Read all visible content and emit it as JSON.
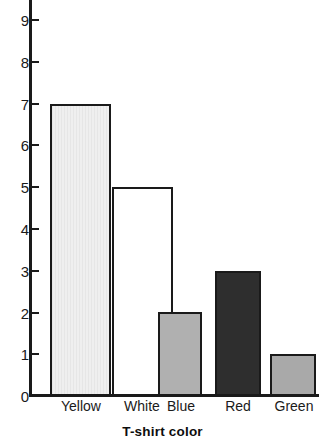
{
  "chart_data": {
    "type": "bar",
    "title": "",
    "subtitle": "",
    "xlabel": "T-shirt color",
    "ylabel": "",
    "categories": [
      "Yellow",
      "White",
      "Blue",
      "Red",
      "Green"
    ],
    "values": [
      7,
      5,
      2,
      3,
      1
    ],
    "ylim": [
      0,
      9
    ],
    "ytick_labels": [
      "0",
      "1",
      "2",
      "3",
      "4",
      "5",
      "6",
      "7",
      "8",
      "9"
    ],
    "ytick_values": [
      0,
      1,
      2,
      3,
      4,
      5,
      6,
      7,
      8,
      9
    ],
    "grid": false,
    "legend": null,
    "annotations": [],
    "bar_fills": [
      "#e9e9e9",
      "#ffffff",
      "#b0b0b0",
      "#2e2e2e",
      "#a9a9a9"
    ],
    "bar_edge_color": "#1a1a1a",
    "axis_color": "#1a1a1a",
    "background_color": "#ffffff"
  },
  "bars": [
    {
      "category": "Yellow",
      "value": 7,
      "fill": "#e9e9e9",
      "striped": true,
      "left": 50,
      "width": 61
    },
    {
      "category": "White",
      "value": 5,
      "fill": "#ffffff",
      "striped": false,
      "left": 112,
      "width": 61
    },
    {
      "category": "Blue",
      "value": 2,
      "fill": "#b0b0b0",
      "striped": false,
      "left": 158,
      "width": 44
    },
    {
      "category": "Red",
      "value": 3,
      "fill": "#2e2e2e",
      "striped": false,
      "left": 215,
      "width": 46
    },
    {
      "category": "Green",
      "value": 1,
      "fill": "#a9a9a9",
      "striped": false,
      "left": 270,
      "width": 46
    }
  ],
  "category_label_positions": [
    {
      "label": "Yellow",
      "left": 47,
      "width": 68
    },
    {
      "label": "White",
      "left": 110,
      "width": 64
    },
    {
      "label": "Blue",
      "left": 155,
      "width": 52
    },
    {
      "label": "Red",
      "left": 212,
      "width": 52
    },
    {
      "label": "Green",
      "left": 266,
      "width": 56
    }
  ],
  "y_axis": {
    "ticks": [
      {
        "label": "9",
        "value": 9,
        "y": 20
      },
      {
        "label": "8",
        "value": 8,
        "y": 62
      },
      {
        "label": "7",
        "value": 7,
        "y": 104
      },
      {
        "label": "6",
        "value": 6,
        "y": 145
      },
      {
        "label": "5",
        "value": 5,
        "y": 187
      },
      {
        "label": "4",
        "value": 4,
        "y": 229
      },
      {
        "label": "3",
        "value": 3,
        "y": 271
      },
      {
        "label": "2",
        "value": 2,
        "y": 313
      },
      {
        "label": "1",
        "value": 1,
        "y": 354
      },
      {
        "label": "0",
        "value": 0,
        "y": 396
      }
    ]
  }
}
